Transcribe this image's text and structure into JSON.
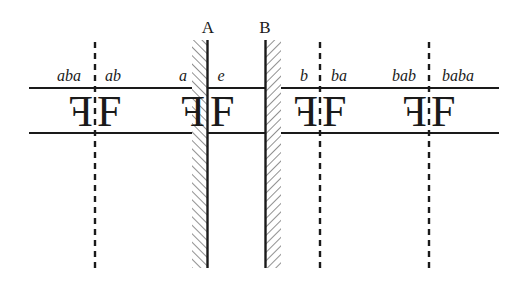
{
  "diagram": {
    "colors": {
      "ink": "#1a1a1a",
      "hatch": "#555555",
      "background": "#ffffff"
    },
    "mirrors": [
      {
        "label": "A",
        "x": 207,
        "hatch_side": "left"
      },
      {
        "label": "B",
        "x": 265,
        "hatch_side": "right"
      }
    ],
    "dashed_lines_x": [
      95,
      320,
      429
    ],
    "rows": {
      "top_y": 88,
      "bottom_y": 133
    },
    "images": [
      {
        "label": "aba",
        "glyph": "F",
        "mirrored": true
      },
      {
        "label": "ab",
        "glyph": "F",
        "mirrored": false
      },
      {
        "label": "a",
        "glyph": "F",
        "mirrored": true
      },
      {
        "label": "e",
        "glyph": "F",
        "mirrored": false
      },
      {
        "label": "b",
        "glyph": "F",
        "mirrored": true
      },
      {
        "label": "ba",
        "glyph": "F",
        "mirrored": false
      },
      {
        "label": "bab",
        "glyph": "F",
        "mirrored": true
      },
      {
        "label": "baba",
        "glyph": "F",
        "mirrored": false
      }
    ]
  }
}
